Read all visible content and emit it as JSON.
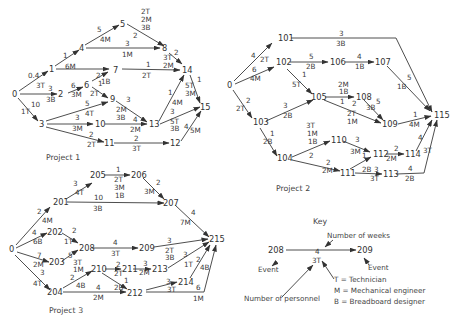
{
  "projects": [
    {
      "caption": "Project 1",
      "nodes": [
        "0",
        "1",
        "2",
        "3",
        "4",
        "5",
        "6",
        "7",
        "8",
        "9",
        "10",
        "11",
        "12",
        "13",
        "14",
        "15"
      ],
      "activities": [
        {
          "from": "0",
          "to": "1",
          "weeks": "0.4",
          "personnel": ""
        },
        {
          "from": "0",
          "to": "2",
          "weeks": "3",
          "personnel": "3T 3B"
        },
        {
          "from": "0",
          "to": "3",
          "weeks": "10",
          "personnel": "1T"
        },
        {
          "from": "1",
          "to": "4",
          "weeks": "1",
          "personnel": "6M"
        },
        {
          "from": "1",
          "to": "7",
          "weeks": "",
          "personnel": "6M"
        },
        {
          "from": "4",
          "to": "5",
          "weeks": "5",
          "personnel": "4M"
        },
        {
          "from": "4",
          "to": "8",
          "weeks": "3",
          "personnel": "1M"
        },
        {
          "from": "5",
          "to": "8",
          "weeks": "2",
          "personnel": "2T 2M 3B"
        },
        {
          "from": "2",
          "to": "6",
          "weeks": "6",
          "personnel": "3M"
        },
        {
          "from": "6",
          "to": "7",
          "weeks": "2",
          "personnel": "1B"
        },
        {
          "from": "6",
          "to": "9",
          "weeks": "1",
          "personnel": "2T"
        },
        {
          "from": "7",
          "to": "14",
          "weeks": "1",
          "personnel": "2T"
        },
        {
          "from": "8",
          "to": "14",
          "weeks": "2",
          "personnel": "3T 2M"
        },
        {
          "from": "3",
          "to": "9",
          "weeks": "5",
          "personnel": "4T"
        },
        {
          "from": "3",
          "to": "10",
          "weeks": "3",
          "personnel": "3M"
        },
        {
          "from": "3",
          "to": "11",
          "weeks": "2",
          "personnel": "2T"
        },
        {
          "from": "9",
          "to": "13",
          "weeks": "3",
          "personnel": "2M 3B"
        },
        {
          "from": "10",
          "to": "13",
          "weeks": "4",
          "personnel": "2M"
        },
        {
          "from": "11",
          "to": "12",
          "weeks": "2",
          "personnel": "3T"
        },
        {
          "from": "13",
          "to": "14",
          "weeks": "1",
          "personnel": "4M"
        },
        {
          "from": "13",
          "to": "15",
          "weeks": "3",
          "personnel": "5T 3B"
        },
        {
          "from": "14",
          "to": "15",
          "weeks": "1",
          "personnel": "5T 3M"
        },
        {
          "from": "12",
          "to": "15",
          "weeks": "4",
          "personnel": "5M"
        }
      ]
    },
    {
      "caption": "Project 2",
      "nodes": [
        "0",
        "101",
        "102",
        "103",
        "104",
        "105",
        "106",
        "107",
        "108",
        "109",
        "110",
        "111",
        "112",
        "113",
        "114",
        "115"
      ],
      "activities": [
        {
          "from": "0",
          "to": "101",
          "weeks": "4",
          "personnel": "2T"
        },
        {
          "from": "0",
          "to": "102",
          "weeks": "6",
          "personnel": "4M"
        },
        {
          "from": "0",
          "to": "103",
          "weeks": "2",
          "personnel": "2T"
        },
        {
          "from": "101",
          "to": "115",
          "weeks": "3",
          "personnel": "3B"
        },
        {
          "from": "102",
          "to": "106",
          "weeks": "5",
          "personnel": "2B"
        },
        {
          "from": "102",
          "to": "105",
          "weeks": "1",
          "personnel": "5T"
        },
        {
          "from": "106",
          "to": "107",
          "weeks": "4",
          "personnel": "1B"
        },
        {
          "from": "107",
          "to": "115",
          "weeks": "5",
          "personnel": "1B"
        },
        {
          "from": "103",
          "to": "105",
          "weeks": "3",
          "personnel": "2B"
        },
        {
          "from": "103",
          "to": "104",
          "weeks": "1",
          "personnel": "2B"
        },
        {
          "from": "105",
          "to": "108",
          "weeks": "1",
          "personnel": "2M 1B"
        },
        {
          "from": "105",
          "to": "109",
          "weeks": "2",
          "personnel": "2T 1M"
        },
        {
          "from": "108",
          "to": "109",
          "weeks": "5",
          "personnel": "3B"
        },
        {
          "from": "109",
          "to": "115",
          "weeks": "1",
          "personnel": "4M"
        },
        {
          "from": "104",
          "to": "110",
          "weeks": "2",
          "personnel": "3T 1M 1B"
        },
        {
          "from": "104",
          "to": "111",
          "weeks": "2",
          "personnel": "2M"
        },
        {
          "from": "110",
          "to": "112",
          "weeks": "3",
          "personnel": "3M"
        },
        {
          "from": "111",
          "to": "112",
          "weeks": "1",
          "personnel": "2B"
        },
        {
          "from": "111",
          "to": "113",
          "weeks": "3",
          "personnel": "3T"
        },
        {
          "from": "112",
          "to": "114",
          "weeks": "2",
          "personnel": "2M"
        },
        {
          "from": "114",
          "to": "115",
          "weeks": "4",
          "personnel": "3T"
        },
        {
          "from": "113",
          "to": "115",
          "weeks": "4",
          "personnel": "2B"
        }
      ]
    },
    {
      "caption": "Project 3",
      "nodes": [
        "0",
        "201",
        "202",
        "203",
        "204",
        "205",
        "206",
        "207",
        "208",
        "209",
        "210",
        "211",
        "212",
        "213",
        "214",
        "215"
      ],
      "activities": [
        {
          "from": "0",
          "to": "201",
          "weeks": "2",
          "personnel": "4M"
        },
        {
          "from": "0",
          "to": "202",
          "weeks": "4",
          "personnel": "6B"
        },
        {
          "from": "0",
          "to": "203",
          "weeks": "7",
          "personnel": "2M"
        },
        {
          "from": "0",
          "to": "204",
          "weeks": "3",
          "personnel": "4T"
        },
        {
          "from": "201",
          "to": "205",
          "weeks": "3",
          "personnel": "4T"
        },
        {
          "from": "201",
          "to": "207",
          "weeks": "10",
          "personnel": "3B"
        },
        {
          "from": "205",
          "to": "206",
          "weeks": "1",
          "personnel": "2T 3M 1B"
        },
        {
          "from": "206",
          "to": "207",
          "weeks": "2",
          "personnel": "3M"
        },
        {
          "from": "207",
          "to": "215",
          "weeks": "4",
          "personnel": "7M"
        },
        {
          "from": "202",
          "to": "208",
          "weeks": "2",
          "personnel": "1T"
        },
        {
          "from": "203",
          "to": "208",
          "weeks": "5",
          "personnel": "3T 1M"
        },
        {
          "from": "208",
          "to": "209",
          "weeks": "4",
          "personnel": "3T"
        },
        {
          "from": "209",
          "to": "215",
          "weeks": "3",
          "personnel": "2T 3B"
        },
        {
          "from": "204",
          "to": "210",
          "weeks": "2",
          "personnel": "4B"
        },
        {
          "from": "204",
          "to": "212",
          "weeks": "4",
          "personnel": "2M"
        },
        {
          "from": "210",
          "to": "211",
          "weeks": "2",
          "personnel": "2T"
        },
        {
          "from": "210",
          "to": "212",
          "weeks": "1",
          "personnel": "2B"
        },
        {
          "from": "211",
          "to": "213",
          "weeks": "3",
          "personnel": "2M"
        },
        {
          "from": "213",
          "to": "215",
          "weeks": "3",
          "personnel": "1T"
        },
        {
          "from": "212",
          "to": "214",
          "weeks": "3",
          "personnel": "3T"
        },
        {
          "from": "214",
          "to": "215",
          "weeks": "2",
          "personnel": "4B"
        },
        {
          "from": "212",
          "to": "215",
          "weeks": "6",
          "personnel": "1M"
        }
      ]
    }
  ],
  "key": {
    "title": "Key",
    "from_event": "208",
    "to_event": "209",
    "weeks": "4",
    "personnel": "3T",
    "label_weeks": "Number of weeks",
    "label_personnel": "Number of personnel",
    "label_event_left": "Event",
    "label_event_right": "Event",
    "legend": [
      "T = Technician",
      "M = Mechanical engineer",
      "B = Breadboard designer"
    ]
  }
}
